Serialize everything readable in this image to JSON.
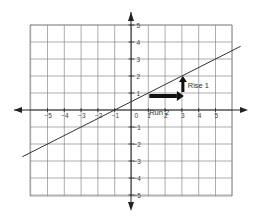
{
  "chart_data": {
    "type": "line",
    "title": "",
    "xlabel": "",
    "ylabel": "",
    "xlim": [
      -6,
      6
    ],
    "ylim": [
      -6,
      6
    ],
    "grid": true,
    "x_ticks": [
      -5,
      -4,
      -3,
      -2,
      -1,
      0,
      1,
      2,
      3,
      4,
      5
    ],
    "y_ticks": [
      -5,
      -4,
      -3,
      -2,
      -1,
      1,
      2,
      3,
      4,
      5
    ],
    "x_tick_labels": [
      "−5",
      "−4",
      "−3",
      "−2",
      "−1",
      "0",
      "1",
      "2",
      "3",
      "4",
      "5"
    ],
    "y_tick_labels": [
      "−5",
      "−4",
      "−3",
      "−2",
      "−1",
      "1",
      "2",
      "3",
      "4",
      "5"
    ],
    "origin_label": "0",
    "series": [
      {
        "name": "line",
        "equation": "y = 1/2 x + 1/2",
        "slope": 0.5,
        "intercept": 0.5,
        "x": [
          -6.5,
          -1,
          1,
          3,
          6.5
        ],
        "y": [
          -2.75,
          0,
          1,
          2,
          3.75
        ]
      }
    ],
    "annotations": [
      {
        "type": "arrow",
        "label": "Run 2",
        "from": [
          1,
          1
        ],
        "to": [
          3,
          1
        ],
        "direction": "right"
      },
      {
        "type": "arrow",
        "label": "Rise 1",
        "from": [
          3,
          1
        ],
        "to": [
          3,
          2
        ],
        "direction": "up"
      }
    ]
  },
  "labels": {
    "origin": "0",
    "run": "Run 2",
    "rise": "Rise 1",
    "x_ticks": [
      "−5",
      "−4",
      "−3",
      "−2",
      "−1",
      "1",
      "2",
      "3",
      "4",
      "5"
    ],
    "y_ticks_pos": [
      "5",
      "4",
      "3",
      "2",
      "1"
    ],
    "y_ticks_neg": [
      "−1",
      "−2",
      "−3",
      "−4",
      "−5"
    ]
  },
  "colors": {
    "grid": "#8a8a8a",
    "axis": "#222222",
    "line": "#333333",
    "arrow": "#111111",
    "text": "#444444"
  }
}
